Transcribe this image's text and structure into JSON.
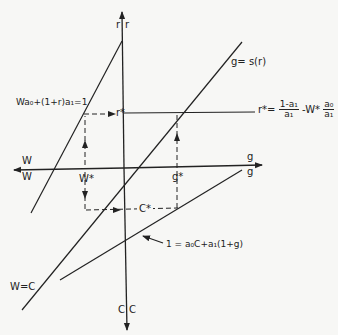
{
  "diagram": {
    "axes": {
      "vertical_top_labels": [
        "r",
        "r"
      ],
      "vertical_bottom_labels": [
        "C",
        "C"
      ],
      "horizontal_left_labels": [
        "W",
        "W"
      ],
      "horizontal_right_labels": [
        "g",
        "g"
      ]
    },
    "curves": {
      "wage_profit": "Wa₀+(1+r)a₁=1",
      "growth_saving": "g= s(r)",
      "wage_consumption": "W=C",
      "consumption_growth": "1 = a₀C+a₁(1+g)"
    },
    "equilibrium": {
      "r_star": "r*",
      "w_star": "W*",
      "g_star": "g*",
      "c_star": "C*"
    },
    "r_star_formula": {
      "lhs": "r*=",
      "frac1_num": "1-a₁",
      "frac1_den": "a₁",
      "middle": "-W*",
      "frac2_num": "a₀",
      "frac2_den": "a₁"
    },
    "colors": {
      "line": "#222222",
      "background": "#f7f7f5"
    }
  }
}
